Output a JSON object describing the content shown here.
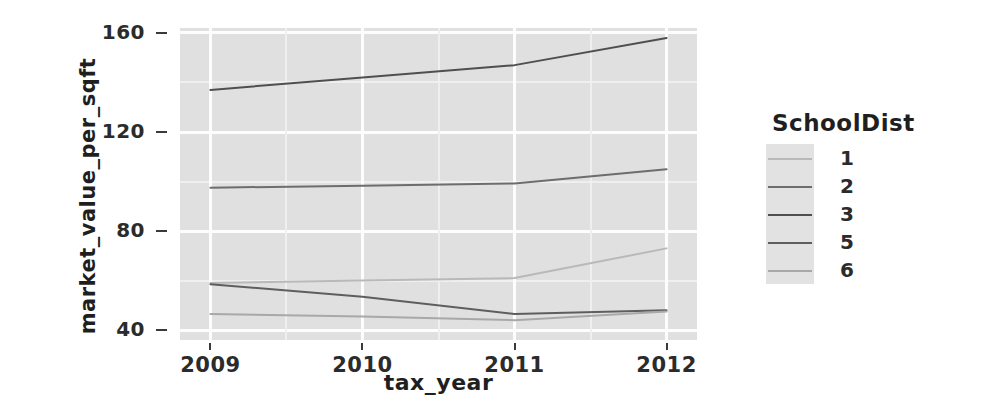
{
  "figure": {
    "background_color": "#ffffff",
    "panel_color": "#e0e0e0",
    "gridline_color": "#fdfdfd"
  },
  "axes": {
    "x_title": "tax_year",
    "y_title": "market_value_per_sqft",
    "x_ticks": [
      "2009",
      "2010",
      "2011",
      "2012"
    ],
    "y_ticks": [
      "40",
      "80",
      "120",
      "160"
    ]
  },
  "legend": {
    "title": "SchoolDist",
    "items": [
      {
        "label": "1",
        "color": "#b9b9b9"
      },
      {
        "label": "2",
        "color": "#6d6d6d"
      },
      {
        "label": "3",
        "color": "#4f4f4f"
      },
      {
        "label": "5",
        "color": "#5e5e5e"
      },
      {
        "label": "6",
        "color": "#a8a8a8"
      }
    ]
  },
  "chart_data": {
    "type": "line",
    "title": "",
    "subtitle": "",
    "xlabel": "tax_year",
    "ylabel": "market_value_per_sqft",
    "x": [
      2009,
      2010,
      2011,
      2012
    ],
    "xlim": [
      2008.8,
      2012.2
    ],
    "ylim": [
      36,
      162
    ],
    "grid": true,
    "legend_position": "right",
    "legend_title": "SchoolDist",
    "series": [
      {
        "name": "1",
        "color": "#b9b9b9",
        "values": [
          59.0,
          60.0,
          61.0,
          73.0
        ]
      },
      {
        "name": "2",
        "color": "#6d6d6d",
        "values": [
          97.5,
          98.3,
          99.2,
          105.0
        ]
      },
      {
        "name": "3",
        "color": "#4f4f4f",
        "values": [
          137.0,
          142.0,
          147.0,
          158.0
        ]
      },
      {
        "name": "5",
        "color": "#5e5e5e",
        "values": [
          58.5,
          53.5,
          46.5,
          48.0
        ]
      },
      {
        "name": "6",
        "color": "#a8a8a8",
        "values": [
          46.5,
          45.5,
          44.0,
          47.5
        ]
      }
    ]
  },
  "geometry": {
    "panel": {
      "left": 180,
      "top": 28,
      "width": 517,
      "height": 312
    },
    "y_scale": {
      "value_at_top": 162,
      "value_at_bottom": 36
    },
    "x_scale": {
      "value_at_left": 2008.8,
      "value_at_right": 2012.2
    }
  }
}
